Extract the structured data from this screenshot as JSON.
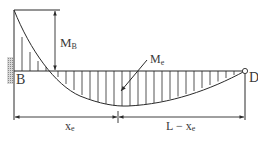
{
  "diagram": {
    "type": "bending-moment-diagram",
    "labels": {
      "support_left": "B",
      "support_right": "D",
      "moment_at_B": {
        "main": "M",
        "sub": "B"
      },
      "moment_at_e": {
        "main": "M",
        "sub": "e"
      },
      "span_left": {
        "main": "x",
        "sub": "e"
      },
      "span_right": {
        "prefix": "L − x",
        "sub": "e"
      }
    },
    "colors": {
      "line": "#2a2a2a",
      "text": "#3a3a3a",
      "hatch": "#9a9a9a",
      "background": "#ffffff"
    }
  }
}
